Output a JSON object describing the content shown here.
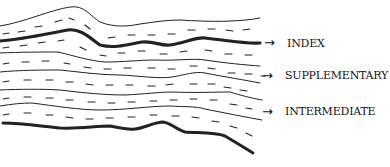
{
  "diagram": {
    "type": "stratigraphic-section",
    "labels": [
      {
        "text": "INDEX",
        "arrow": "→",
        "points_to": "thick-upper-bed"
      },
      {
        "text": "SUPPLEMENTARY",
        "arrow": "→",
        "points_to": "thin-bed"
      },
      {
        "text": "INTERMEDIATE",
        "arrow": "→",
        "points_to": "thin-bed"
      }
    ],
    "colors": {
      "line": "#111111",
      "background": "#ffffff"
    }
  }
}
